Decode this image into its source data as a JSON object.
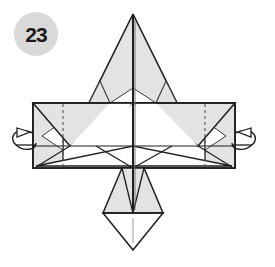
{
  "figure": {
    "kind": "origami-folding-diagram",
    "step_label": "23",
    "background_color": "#ffffff"
  },
  "badge": {
    "label": "23",
    "circle_fill": "#d9d9d9",
    "text_color": "#1a1a1a",
    "center_x": 36,
    "center_y": 34,
    "radius": 22
  },
  "palette": {
    "paper_shaded": "#e3e3e1",
    "paper_white": "#ffffff",
    "line_dark": "#1f1f1f",
    "line_mid": "#3a3a3a",
    "crease_dash": "#555555",
    "arrow_stroke": "#1f1f1f"
  },
  "geometry": {
    "center_x": 133,
    "band": {
      "left": 33,
      "right": 235,
      "top": 103,
      "bottom": 168
    },
    "top_point": {
      "apex_x": 133,
      "apex_y": 14,
      "base_y": 103,
      "left_x": 89,
      "right_x": 177
    },
    "bottom_point": {
      "top_y": 168,
      "shoulder_y": 213,
      "apex_y": 250,
      "left_x": 103,
      "right_x": 163
    },
    "center_spine": {
      "x": 133,
      "top_y": 14,
      "bottom_y": 213
    }
  },
  "annotations": {
    "left_arrow": {
      "name": "fold-arrow-left",
      "direction": "curl-right",
      "x": 20,
      "y": 141
    },
    "right_arrow": {
      "name": "fold-arrow-right",
      "direction": "curl-left",
      "x": 250,
      "y": 141
    }
  },
  "layers": {
    "top_point_label": "upper triangular point",
    "band_label": "horizontal folded band",
    "bottom_point_label": "lower triangular point",
    "left_flap_label": "left side flap",
    "right_flap_label": "right side flap"
  }
}
